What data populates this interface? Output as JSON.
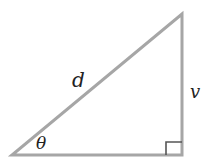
{
  "diagram": {
    "type": "right-triangle",
    "colors": {
      "stroke": "#a6a6a6",
      "right_angle_marker": "#555555",
      "label": "#222222"
    },
    "vertices": {
      "bottom_left": [
        12,
        155
      ],
      "bottom_right": [
        182,
        155
      ],
      "top": [
        182,
        14
      ]
    },
    "labels": {
      "hypotenuse": "d",
      "vertical_side": "v",
      "angle": "θ"
    },
    "right_angle_marker": {
      "at": "bottom_right",
      "size": 13
    }
  }
}
